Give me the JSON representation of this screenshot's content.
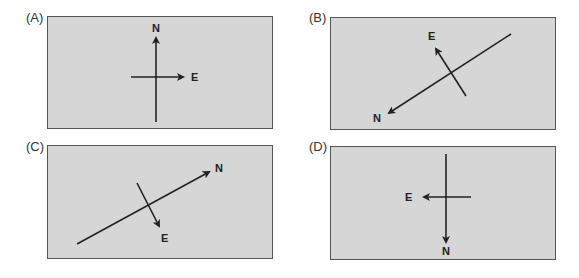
{
  "colors": {
    "panel_fill": "#d6d6d6",
    "panel_border": "#555555",
    "arrow": "#222222",
    "label": "#333333"
  },
  "panels": [
    {
      "id": "A",
      "label": "(A)",
      "north_label": "N",
      "east_label": "E",
      "north_direction": "up",
      "east_direction": "right"
    },
    {
      "id": "B",
      "label": "(B)",
      "north_label": "N",
      "east_label": "E",
      "north_direction": "down-left",
      "east_direction": "up-left"
    },
    {
      "id": "C",
      "label": "(C)",
      "north_label": "N",
      "east_label": "E",
      "north_direction": "up-right",
      "east_direction": "down-right"
    },
    {
      "id": "D",
      "label": "(D)",
      "north_label": "N",
      "east_label": "E",
      "north_direction": "down",
      "east_direction": "left"
    }
  ]
}
